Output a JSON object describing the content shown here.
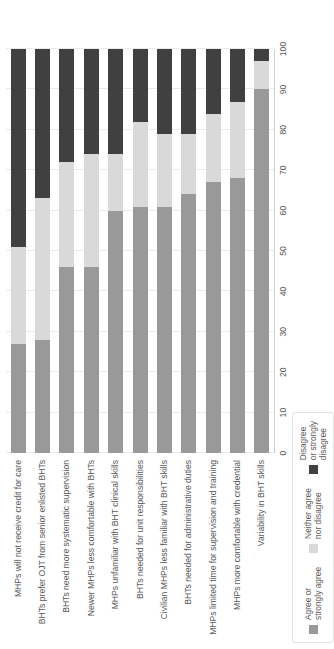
{
  "chart_data": {
    "type": "bar",
    "orientation": "horizontal",
    "stacked": true,
    "title": "",
    "xlabel": "",
    "ylabel": "",
    "xlim": [
      0,
      100
    ],
    "grid": true,
    "legend_position": "bottom-left",
    "xticks": [
      "0",
      "10",
      "20",
      "30",
      "40",
      "50",
      "60",
      "70",
      "80",
      "90",
      "100"
    ],
    "categories": [
      "MHPs will not receive credit for care",
      "BHTs prefer OJT from senior enlisted BHTs",
      "BHTs need more systematic supervision",
      "Newer MHPs less comfortable with BHTs",
      "MHPs unfamiliar with BHT clinical skills",
      "BHTs needed for unit responsibilities",
      "Civilian MHPs less familiar with BHT skills",
      "BHTs needed for administrative duties",
      "MHPs limited time for supervision and training",
      "MHPs more comfortable with credential",
      "Variability in BHT skills"
    ],
    "series": [
      {
        "name": "Agree or\nstrongly agree",
        "color": "#999999",
        "values": [
          27,
          28,
          46,
          46,
          60,
          61,
          61,
          64,
          67,
          68,
          90
        ]
      },
      {
        "name": "Neither agree\nnor disagree",
        "color": "#d9d9d9",
        "values": [
          24,
          35,
          26,
          28,
          14,
          21,
          18,
          15,
          17,
          19,
          7
        ]
      },
      {
        "name": "Disagree\nor strongly\ndisagree",
        "color": "#404040",
        "values": [
          49,
          37,
          28,
          26,
          26,
          18,
          21,
          21,
          16,
          13,
          3
        ]
      }
    ]
  }
}
